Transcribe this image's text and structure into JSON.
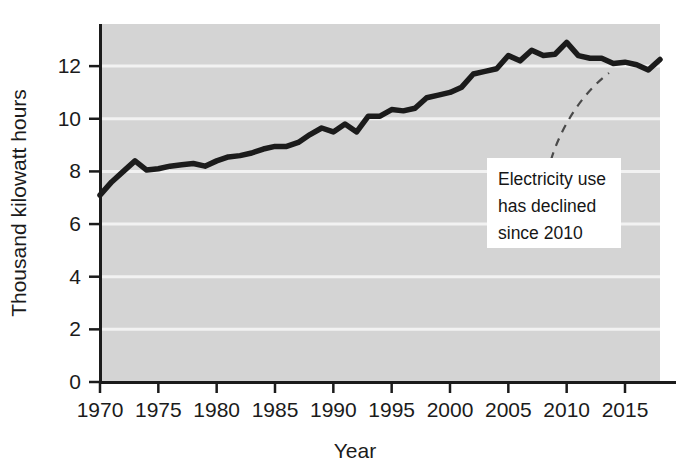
{
  "chart_data": {
    "type": "line",
    "title": "",
    "xlabel": "Year",
    "ylabel": "Thousand kilowatt hours",
    "xlim": [
      1970,
      2018
    ],
    "ylim": [
      0,
      13.6
    ],
    "grid": true,
    "legend": null,
    "xticks": [
      "1970",
      "1975",
      "1980",
      "1985",
      "1990",
      "1995",
      "2000",
      "2005",
      "2010",
      "2015"
    ],
    "xtick_values": [
      1970,
      1975,
      1980,
      1985,
      1990,
      1995,
      2000,
      2005,
      2010,
      2015
    ],
    "yticks": [
      "0",
      "2",
      "4",
      "6",
      "8",
      "10",
      "12"
    ],
    "ytick_values": [
      0,
      2,
      4,
      6,
      8,
      10,
      12
    ],
    "x": [
      1970,
      1971,
      1972,
      1973,
      1974,
      1975,
      1976,
      1977,
      1978,
      1979,
      1980,
      1981,
      1982,
      1983,
      1984,
      1985,
      1986,
      1987,
      1988,
      1989,
      1990,
      1991,
      1992,
      1993,
      1994,
      1995,
      1996,
      1997,
      1998,
      1999,
      2000,
      2001,
      2002,
      2003,
      2004,
      2005,
      2006,
      2007,
      2008,
      2009,
      2010,
      2011,
      2012,
      2013,
      2014,
      2015,
      2016,
      2017,
      2018
    ],
    "values": [
      7.1,
      7.6,
      8.0,
      8.4,
      8.05,
      8.1,
      8.2,
      8.25,
      8.3,
      8.2,
      8.4,
      8.55,
      8.6,
      8.7,
      8.85,
      8.95,
      8.95,
      9.1,
      9.4,
      9.65,
      9.5,
      9.8,
      9.5,
      10.1,
      10.1,
      10.35,
      10.3,
      10.4,
      10.8,
      10.9,
      11.0,
      11.2,
      11.7,
      11.8,
      11.9,
      12.4,
      12.2,
      12.6,
      12.4,
      12.45,
      12.9,
      12.4,
      12.3,
      12.3,
      12.1,
      12.15,
      12.05,
      11.85,
      12.25
    ],
    "series_name": "Average annual residential electricity use",
    "line_color": "#1b1b1b",
    "plot_background": "#d4d4d4",
    "gridline_color": "#f2f2f2",
    "annotation": {
      "lines": [
        "Electricity use",
        "has declined",
        "since 2010"
      ],
      "background": "#ffffff",
      "leader_style": "dashed-curve",
      "points_to_year": 2010
    }
  }
}
